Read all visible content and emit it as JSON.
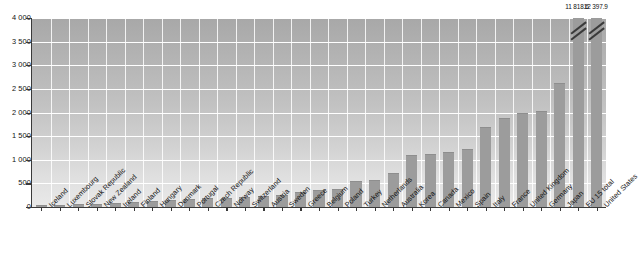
{
  "chart_data": {
    "type": "bar",
    "title": "",
    "xlabel": "",
    "ylabel": "",
    "ylim": [
      0,
      4000
    ],
    "ytick_labels": [
      "4 000",
      "3 500",
      "3 000",
      "2 500",
      "2 000",
      "1 500",
      "1 000",
      "500",
      "0"
    ],
    "ytick_values": [
      4000,
      3500,
      3000,
      2500,
      2000,
      1500,
      1000,
      500,
      0
    ],
    "grid": true,
    "legend": "none",
    "bar_color": "#9c9c9c",
    "categories": [
      "Iceland",
      "Luxembourg",
      "Slovak Republic",
      "New Zealand",
      "Ireland",
      "Finland",
      "Hungary",
      "Denmark",
      "Portugal",
      "Czech Republic",
      "Norway",
      "Switzerland",
      "Austria",
      "Sweden",
      "Greece",
      "Belgium",
      "Poland",
      "Turkey",
      "Netherlands",
      "Australia",
      "Korea",
      "Canada",
      "Mexico",
      "Spain",
      "Italy",
      "France",
      "United Kingdom",
      "Germany",
      "Japan",
      "EU 15 total",
      "United States"
    ],
    "values": [
      10,
      20,
      35,
      45,
      60,
      90,
      110,
      130,
      150,
      165,
      180,
      200,
      220,
      240,
      290,
      330,
      350,
      520,
      560,
      690,
      1080,
      1110,
      1140,
      1200,
      1680,
      1870,
      1960,
      2010,
      2600,
      11818.6,
      12397.9
    ],
    "clipped_bars": [
      "EU 15 total",
      "United States"
    ],
    "annotations": [
      {
        "label": "11 818.6",
        "category": "EU 15 total"
      },
      {
        "label": "12 397.9",
        "category": "United States"
      }
    ]
  },
  "footnote": ""
}
